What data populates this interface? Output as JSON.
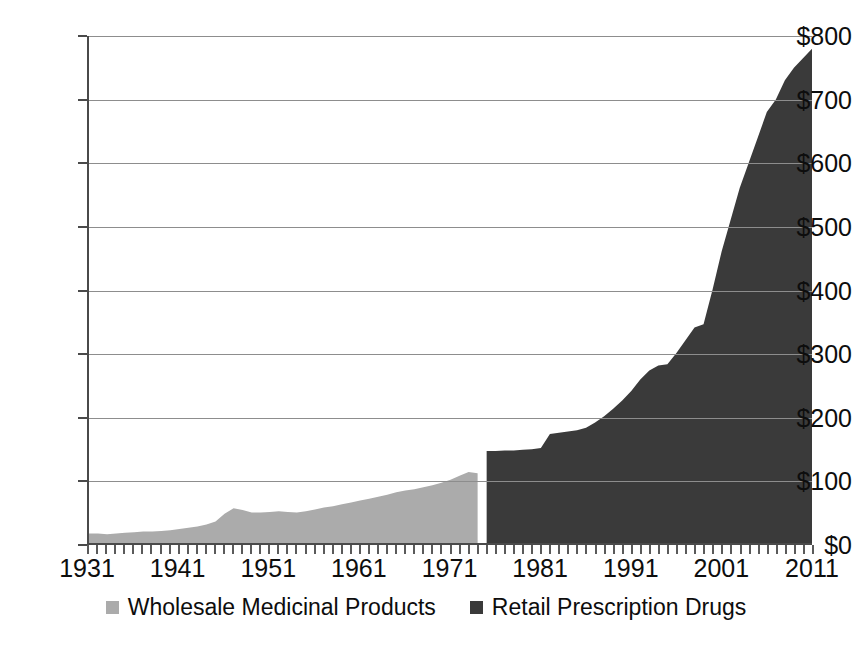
{
  "chart_data": {
    "type": "area",
    "title": "",
    "subtitle": "",
    "xlabel": "",
    "ylabel": "",
    "xlim": [
      1931,
      2011
    ],
    "ylim": [
      0,
      800
    ],
    "grid": true,
    "legend_position": "bottom",
    "y_tick_labels": [
      "$0",
      "$100",
      "$200",
      "$300",
      "$400",
      "$500",
      "$600",
      "$700",
      "$800"
    ],
    "y_tick_values": [
      0,
      100,
      200,
      300,
      400,
      500,
      600,
      700,
      800
    ],
    "x_tick_labels": [
      "1931",
      "1941",
      "1951",
      "1961",
      "1971",
      "1981",
      "1991",
      "2001",
      "2011"
    ],
    "x_tick_values": [
      1931,
      1941,
      1951,
      1961,
      1971,
      1981,
      1991,
      2001,
      2011
    ],
    "x_minor_tick_step": 1,
    "colors": {
      "wholesale": "#ababab",
      "retail": "#3a3a3a",
      "gridline": "#8d8d8d",
      "axis": "#4a4a4a",
      "text": "#0d0d0d",
      "background": "#ffffff"
    },
    "series": [
      {
        "name": "Wholesale Medicinal Products",
        "color": "#ababab",
        "x": [
          1931,
          1932,
          1933,
          1934,
          1935,
          1936,
          1937,
          1938,
          1939,
          1940,
          1941,
          1942,
          1943,
          1944,
          1945,
          1946,
          1947,
          1948,
          1949,
          1950,
          1951,
          1952,
          1953,
          1954,
          1955,
          1956,
          1957,
          1958,
          1959,
          1960,
          1961,
          1962,
          1963,
          1964,
          1965,
          1966,
          1967,
          1968,
          1969,
          1970,
          1971,
          1972,
          1973,
          1974
        ],
        "values": [
          15,
          15,
          14,
          15,
          16,
          17,
          18,
          18,
          19,
          20,
          22,
          24,
          26,
          29,
          34,
          46,
          55,
          52,
          48,
          48,
          49,
          50,
          49,
          48,
          50,
          53,
          56,
          58,
          61,
          64,
          67,
          70,
          73,
          76,
          80,
          83,
          85,
          88,
          91,
          95,
          100,
          106,
          112,
          110
        ]
      },
      {
        "name": "Retail Prescription Drugs",
        "color": "#3a3a3a",
        "x": [
          1975,
          1976,
          1977,
          1978,
          1979,
          1980,
          1981,
          1982,
          1983,
          1984,
          1985,
          1986,
          1987,
          1988,
          1989,
          1990,
          1991,
          1992,
          1993,
          1994,
          1995,
          1996,
          1997,
          1998,
          1999,
          2000,
          2001,
          2002,
          2003,
          2004,
          2005,
          2006,
          2007,
          2008,
          2009,
          2010,
          2011
        ],
        "values": [
          145,
          145,
          146,
          146,
          147,
          148,
          150,
          172,
          174,
          176,
          178,
          182,
          190,
          200,
          212,
          225,
          240,
          258,
          272,
          280,
          282,
          300,
          320,
          340,
          345,
          400,
          460,
          510,
          560,
          600,
          640,
          680,
          700,
          730,
          750,
          765,
          780
        ]
      }
    ],
    "annotations": [
      "Wholesale series spans 1931-1974; Retail series spans 1975-2011"
    ]
  },
  "legend": {
    "entries": [
      {
        "label": "Wholesale Medicinal Products",
        "color": "#ababab",
        "swatch_name": "legend-swatch-wholesale"
      },
      {
        "label": "Retail Prescription Drugs",
        "color": "#3a3a3a",
        "swatch_name": "legend-swatch-retail"
      }
    ]
  }
}
